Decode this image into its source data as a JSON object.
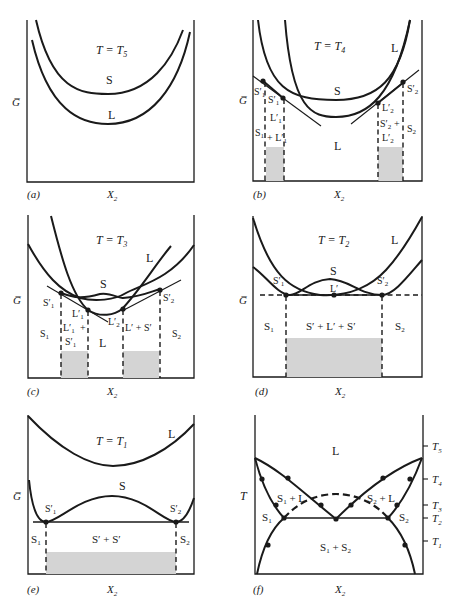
{
  "figure": {
    "common": {
      "y_axis": "G̅",
      "x_axis": "X",
      "x_axis_sub": "2",
      "temperature_symbol": "T"
    },
    "panels": [
      {
        "id": "a",
        "tag": "(a)",
        "title_T": "T = T",
        "title_sub": "5",
        "labels": {
          "solid": "S",
          "liquid": "L"
        }
      },
      {
        "id": "b",
        "tag": "(b)",
        "title_T": "T = T",
        "title_sub": "4",
        "labels": {
          "solid": "S",
          "liquid_curve": "L",
          "liquid_region": "L",
          "s1p_outer": "S′",
          "s1p_outer_sub": "1",
          "s1p_inner": "S′",
          "s1p_inner_sub": "1",
          "l1p": "L′",
          "l1p_sub": "1",
          "s1": "S",
          "s1_sub": "1",
          "plus_l1p": "+ L′",
          "plus_l1p_sub": "1",
          "l2p": "L′",
          "l2p_sub": "2",
          "s2p_plus": "S′",
          "s2p_plus_sub": "2",
          "plus": "+",
          "l2p_b": "L′",
          "l2p_b_sub": "2",
          "s2p": "S′",
          "s2p_sub": "2",
          "s2": "S",
          "s2_sub": "2"
        }
      },
      {
        "id": "c",
        "tag": "(c)",
        "title_T": "T = T",
        "title_sub": "3",
        "labels": {
          "solid": "S",
          "liquid_curve": "L",
          "liquid_region": "L",
          "s1p": "S′",
          "s1p_sub": "1",
          "l1p": "L′",
          "l1p_sub": "1",
          "l1p_plus": "L′",
          "l1p_plus_sub": "1",
          "plus": "+",
          "s1p_b": "S′",
          "s1p_b_sub": "1",
          "l2p": "L′",
          "l2p_sub": "2",
          "l2p_plus_s2p": "L′ + S′",
          "s2p": "S′",
          "s2p_sub": "2",
          "s1": "S",
          "s1_sub": "1",
          "s2": "S",
          "s2_sub": "2"
        }
      },
      {
        "id": "d",
        "tag": "(d)",
        "title_T": "T = T",
        "title_sub": "2",
        "labels": {
          "solid": "S",
          "liquid_curve": "L",
          "lp": "L′",
          "s1p": "S′",
          "s1p_sub": "1",
          "s2p": "S′",
          "s2p_sub": "2",
          "s1": "S",
          "s1_sub": "1",
          "s2": "S",
          "s2_sub": "2",
          "three_phase": "S′ + L′ + S′"
        }
      },
      {
        "id": "e",
        "tag": "(e)",
        "title_T": "T = T",
        "title_sub": "1",
        "labels": {
          "solid": "S",
          "liquid_curve": "L",
          "s1p": "S′",
          "s1p_sub": "1",
          "s2p": "S′",
          "s2p_sub": "2",
          "s1": "S",
          "s1_sub": "1",
          "s2": "S",
          "s2_sub": "2",
          "two_phase": "S′ + S′"
        }
      },
      {
        "id": "f",
        "tag": "(f)",
        "labels": {
          "liquid": "L",
          "s1_plus_l": "S + L",
          "s2_plus_l": "S + L",
          "s1": "S",
          "s2": "S",
          "s1_plus_s2": "S + S",
          "sub1": "1",
          "sub2": "2"
        },
        "temperature_ticks": [
          {
            "label": "T",
            "sub": "5"
          },
          {
            "label": "T",
            "sub": "4"
          },
          {
            "label": "T",
            "sub": "3"
          },
          {
            "label": "T",
            "sub": "2"
          },
          {
            "label": "T",
            "sub": "1"
          }
        ]
      }
    ]
  }
}
